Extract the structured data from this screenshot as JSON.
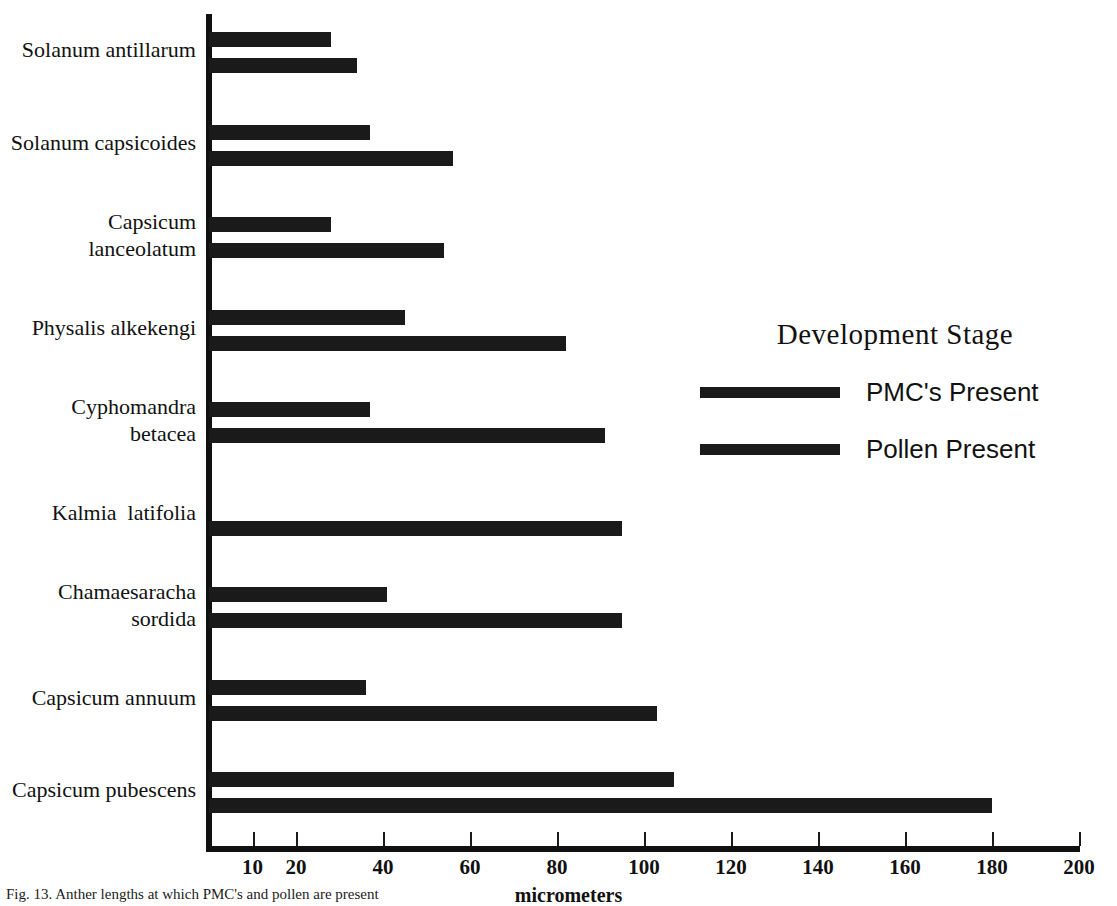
{
  "chart_data": {
    "type": "bar",
    "orientation": "horizontal",
    "title": "",
    "xlabel": "micrometers",
    "ylabel": "",
    "xlim": [
      0,
      200
    ],
    "ylim": null,
    "grid": false,
    "xticks": [
      10,
      20,
      40,
      60,
      80,
      100,
      120,
      140,
      160,
      180,
      200
    ],
    "xtick_labels": [
      "10",
      "20",
      "40",
      "60",
      "80",
      "100",
      "120",
      "140",
      "160",
      "180",
      "200"
    ],
    "legend": {
      "title": "Development Stage",
      "position": "inside-right",
      "entries": [
        {
          "name": "PMC's Present",
          "color": "#1a1a1a"
        },
        {
          "name": "Pollen Present",
          "color": "#1a1a1a"
        }
      ]
    },
    "categories": [
      "Solanum antillarum",
      "Solanum capsicoides",
      "Capsicum lanceolatum",
      "Physalis alkekengi",
      "Cyphomandra betacea",
      "Kalmia  latifolia",
      "Chamaesaracha sordida",
      "Capsicum annuum",
      "Capsicum pubescens"
    ],
    "series": [
      {
        "name": "PMC's Present",
        "values": [
          28,
          37,
          28,
          45,
          37,
          0,
          41,
          36,
          107
        ]
      },
      {
        "name": "Pollen Present",
        "values": [
          34,
          56,
          54,
          82,
          91,
          95,
          95,
          103,
          180
        ]
      }
    ]
  },
  "axis": {
    "x_label": "micrometers"
  },
  "category_labels": [
    {
      "line1": "Solanum antillarum",
      "line2": ""
    },
    {
      "line1": "Solanum capsicoides",
      "line2": ""
    },
    {
      "line1": "Capsicum",
      "line2": "lanceolatum"
    },
    {
      "line1": "Physalis alkekengi",
      "line2": ""
    },
    {
      "line1": "Cyphomandra",
      "line2": "betacea"
    },
    {
      "line1": "Kalmia  latifolia",
      "line2": ""
    },
    {
      "line1": "Chamaesaracha",
      "line2": "sordida"
    },
    {
      "line1": "Capsicum annuum",
      "line2": ""
    },
    {
      "line1": "Capsicum pubescens",
      "line2": ""
    }
  ],
  "legend": {
    "title": "Development Stage",
    "item1": "PMC's Present",
    "item2": "Pollen Present"
  },
  "caption": {
    "text": "Fig. 13. Anther lengths at which PMC's and pollen are present"
  }
}
